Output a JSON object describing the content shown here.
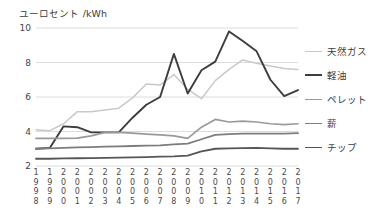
{
  "axis_title": "ユーロセント /kWh",
  "legend": {
    "items": [
      {
        "label": "天然ガス",
        "color": "#c9c9c9",
        "width": 1.5,
        "top": 0
      },
      {
        "label": "軽油",
        "color": "#3d3d3d",
        "width": 2.0,
        "top": 24
      },
      {
        "label": "ペレット",
        "color": "#9a9a9a",
        "width": 1.7,
        "top": 48
      },
      {
        "label": "薪",
        "color": "#7d7d7d",
        "width": 1.8,
        "top": 72
      },
      {
        "label": "チップ",
        "color": "#565656",
        "width": 1.8,
        "top": 96
      }
    ]
  },
  "chart_data": {
    "type": "line",
    "title": "",
    "xlabel": "",
    "ylabel": "ユーロセント /kWh",
    "ylim": [
      2,
      10
    ],
    "yticks": [
      2,
      4,
      6,
      8,
      10
    ],
    "grid": true,
    "grid_color": "#dcdcdc",
    "legend_position": "right",
    "categories": [
      "1998",
      "1999",
      "2000",
      "2001",
      "2002",
      "2003",
      "2004",
      "2005",
      "2006",
      "2007",
      "2008",
      "2009",
      "2010",
      "2011",
      "2012",
      "2013",
      "2014",
      "2015",
      "2016",
      "2017"
    ],
    "series": [
      {
        "name": "天然ガス",
        "color": "#c9c9c9",
        "width": 1.5,
        "values": [
          4.1,
          4.05,
          4.45,
          5.15,
          5.15,
          5.25,
          5.35,
          5.95,
          6.75,
          6.7,
          7.3,
          6.45,
          5.9,
          6.95,
          7.6,
          8.15,
          7.95,
          7.8,
          7.65,
          7.6
        ]
      },
      {
        "name": "軽油",
        "color": "#3d3d3d",
        "width": 1.9,
        "values": [
          3.0,
          3.05,
          4.3,
          4.25,
          3.95,
          3.95,
          3.95,
          4.8,
          5.55,
          6.0,
          8.5,
          6.2,
          7.55,
          8.05,
          9.8,
          9.25,
          8.65,
          7.0,
          6.05,
          6.4
        ]
      },
      {
        "name": "ペレット",
        "color": "#9a9a9a",
        "width": 1.7,
        "values": [
          3.6,
          3.6,
          3.6,
          3.62,
          3.75,
          3.95,
          3.95,
          3.9,
          3.85,
          3.8,
          3.75,
          3.6,
          4.25,
          4.7,
          4.55,
          4.6,
          4.55,
          4.45,
          4.4,
          4.45
        ]
      },
      {
        "name": "薪",
        "color": "#7d7d7d",
        "width": 1.8,
        "values": [
          3.0,
          3.02,
          3.05,
          3.08,
          3.1,
          3.12,
          3.14,
          3.16,
          3.18,
          3.2,
          3.25,
          3.3,
          3.55,
          3.8,
          3.85,
          3.88,
          3.88,
          3.88,
          3.88,
          3.9
        ]
      },
      {
        "name": "チップ",
        "color": "#565656",
        "width": 1.8,
        "values": [
          2.42,
          2.42,
          2.44,
          2.45,
          2.46,
          2.47,
          2.48,
          2.5,
          2.52,
          2.54,
          2.56,
          2.6,
          2.85,
          3.0,
          3.02,
          3.04,
          3.05,
          3.02,
          3.0,
          3.0
        ]
      }
    ]
  }
}
